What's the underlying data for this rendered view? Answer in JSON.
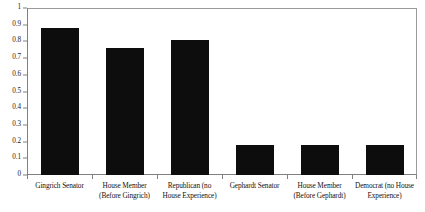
{
  "chart_data": {
    "type": "bar",
    "title": "",
    "subtitle": "",
    "xlabel": "",
    "ylabel": "",
    "ylim": [
      0,
      1
    ],
    "grid": false,
    "legend": "none",
    "categories": [
      "Gingrich Senator",
      "House Member (Before Gingrich)",
      "Republican (no House Experience)",
      "Gephardt Senator",
      "House Member (Before Gephardt)",
      "Democrat (no House Experience)"
    ],
    "category_lines": [
      [
        "Gingrich Senator"
      ],
      [
        "House Member",
        "(Before Gingrich)"
      ],
      [
        "Republican (no",
        "House Experience)"
      ],
      [
        "Gephardt Senator"
      ],
      [
        "House Member",
        "(Before Gephardt)"
      ],
      [
        "Democrat (no House",
        "Experience)"
      ]
    ],
    "values": [
      0.88,
      0.76,
      0.81,
      0.18,
      0.18,
      0.18
    ],
    "ytick_labels": [
      "1",
      "0.9",
      "0.8",
      "0.7",
      "0.6",
      "0.5",
      "0.4",
      "0.3",
      "0.2",
      "0.1",
      "0"
    ],
    "ytick_values": [
      1,
      0.9,
      0.8,
      0.7,
      0.6,
      0.5,
      0.4,
      0.3,
      0.2,
      0.1,
      0
    ],
    "bar_color": "#0d0d0d",
    "axis_color": "#808080",
    "background_color": "#ffffff"
  }
}
